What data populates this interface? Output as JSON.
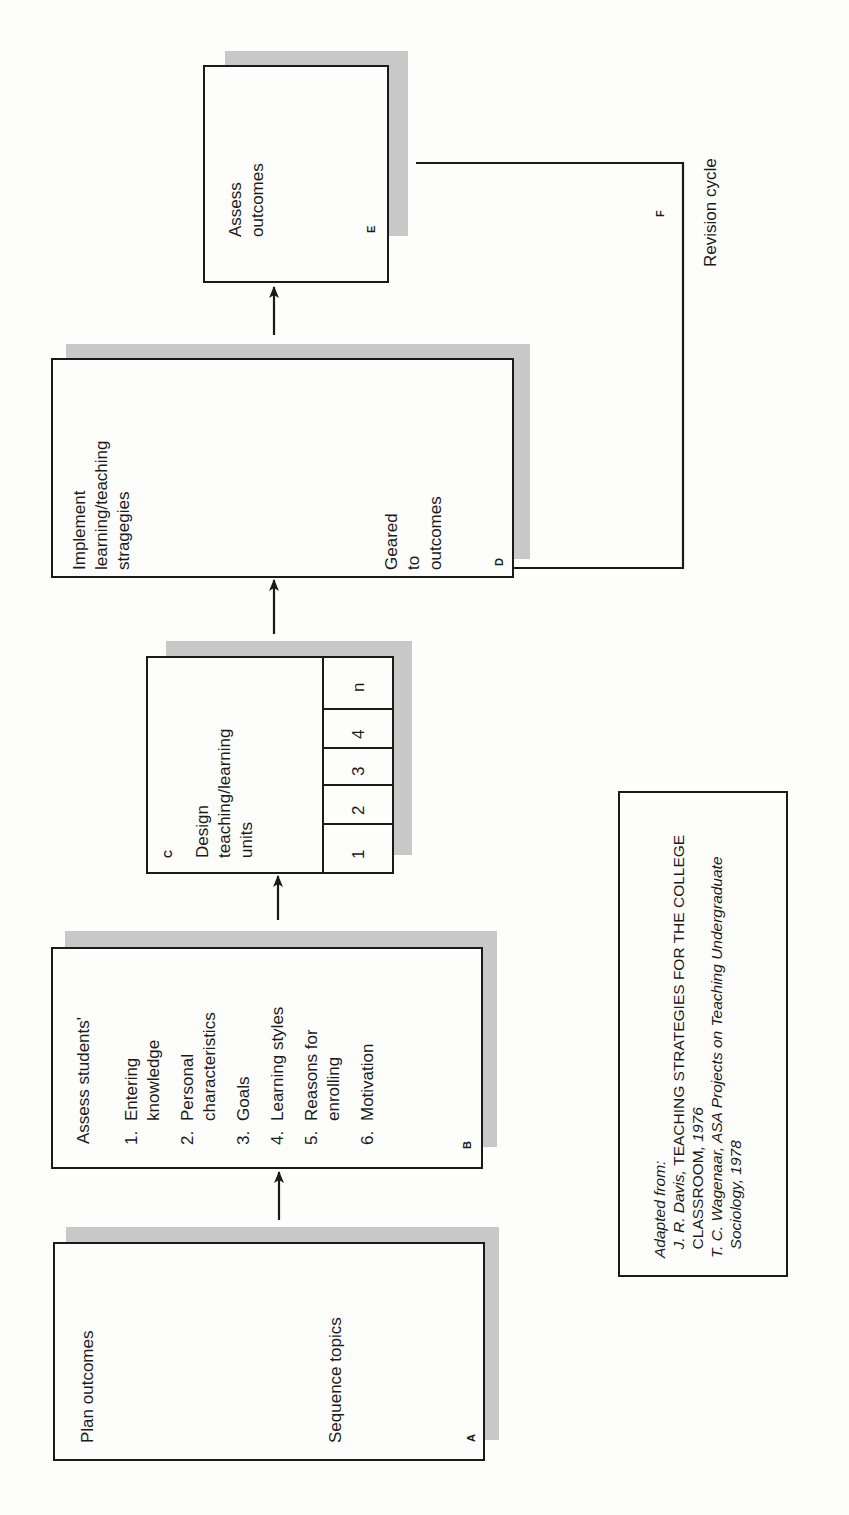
{
  "diagram": {
    "orientation": "rotated -90deg (reads bottom-to-top)",
    "boxes": {
      "A": {
        "label": "A",
        "from_text": "Plan outcomes",
        "to_text": "Sequence topics"
      },
      "B": {
        "label": "B",
        "title": "Assess students'",
        "items": [
          {
            "num": "1.",
            "lines": [
              "Entering",
              "knowledge"
            ]
          },
          {
            "num": "2.",
            "lines": [
              "Personal",
              "characteristics"
            ]
          },
          {
            "num": "3.",
            "lines": [
              "Goals"
            ]
          },
          {
            "num": "4.",
            "lines": [
              "Learning styles"
            ]
          },
          {
            "num": "5.",
            "lines": [
              "Reasons for",
              "enrolling"
            ]
          },
          {
            "num": "6.",
            "lines": [
              "Motivation"
            ]
          }
        ]
      },
      "C": {
        "label": "C",
        "title_lines": [
          "Design",
          "teaching/learning",
          "units"
        ],
        "units": [
          "1",
          "2",
          "3",
          "4",
          "n"
        ]
      },
      "D": {
        "label": "D",
        "from_lines": [
          "Implement",
          "learning/teaching",
          "stragegies"
        ],
        "to_lines": [
          "Geared",
          "to",
          "outcomes"
        ]
      },
      "E": {
        "label": "E",
        "title_lines": [
          "Assess",
          "outcomes"
        ]
      }
    },
    "revision": {
      "label": "F",
      "text": "Revision cycle"
    },
    "flow": [
      "A",
      "B",
      "C",
      "D",
      "E",
      "F→C"
    ],
    "citation": {
      "intro": "Adapted from:",
      "line1_author": "J. R. Davis, ",
      "line1_title": "TEACHING STRATEGIES FOR THE COLLEGE",
      "line2_title": "CLASSROOM",
      "line2_rest": ", 1976",
      "line3_author": "T. C. Wagenaar, ",
      "line3_title": "ASA Projects on Teaching Undergraduate",
      "line4_title": "Sociology",
      "line4_rest": ", 1978"
    }
  }
}
